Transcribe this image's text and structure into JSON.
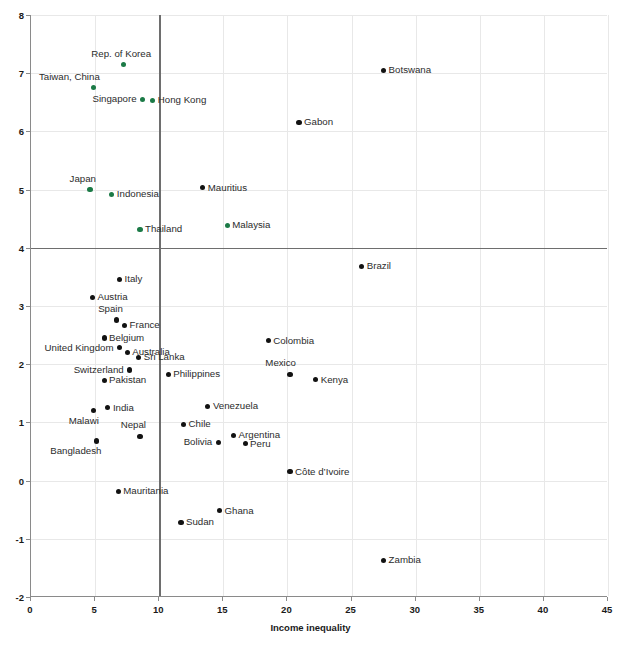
{
  "axis": {
    "xlabel": "Income inequality",
    "ylabel": "",
    "xticks": [
      "0",
      "5",
      "10",
      "15",
      "20",
      "25",
      "30",
      "35",
      "40",
      "45"
    ],
    "yticks": [
      "8",
      "7",
      "6",
      "5",
      "4",
      "3",
      "2",
      "1",
      "0",
      "-1",
      "-2"
    ]
  },
  "colors": {
    "asia_green": "#1b7a46",
    "other_black": "#121212",
    "grid": "#e8e8e8",
    "reference_line": "#6e6e6e",
    "axis": "#8a8a8a"
  },
  "chart_data": {
    "type": "scatter",
    "title": "",
    "xlabel": "Income inequality",
    "ylabel": "",
    "xlim": [
      0,
      45
    ],
    "ylim": [
      -2,
      8
    ],
    "xticks": [
      0,
      5,
      10,
      15,
      20,
      25,
      30,
      35,
      40,
      45
    ],
    "yticks": [
      8,
      7,
      6,
      5,
      4,
      3,
      2,
      1,
      0,
      -1,
      -2
    ],
    "grid": true,
    "legend": "none",
    "reference_lines": {
      "horizontal": 4,
      "vertical": 10
    },
    "series": [
      {
        "name": "East and Southeast Asia",
        "color": "#1b7a46",
        "points": [
          {
            "label": "Rep. of Korea",
            "x": 7.2,
            "y": 7.15,
            "lpos": "above"
          },
          {
            "label": "Taiwan, China",
            "x": 4.9,
            "y": 6.75,
            "lpos": "above-left"
          },
          {
            "label": "Singapore",
            "x": 8.7,
            "y": 6.55,
            "lpos": "left"
          },
          {
            "label": "Hong Kong",
            "x": 9.5,
            "y": 6.53,
            "lpos": "right"
          },
          {
            "label": "Japan",
            "x": 4.6,
            "y": 5.0,
            "lpos": "above-left"
          },
          {
            "label": "Indonesia",
            "x": 6.3,
            "y": 4.92,
            "lpos": "right"
          },
          {
            "label": "Thailand",
            "x": 8.5,
            "y": 4.32,
            "lpos": "right"
          },
          {
            "label": "Malaysia",
            "x": 15.3,
            "y": 4.38,
            "lpos": "right"
          }
        ]
      },
      {
        "name": "Rest of the world",
        "color": "#121212",
        "points": [
          {
            "label": "Botswana",
            "x": 27.5,
            "y": 7.05,
            "lpos": "right"
          },
          {
            "label": "Gabon",
            "x": 20.9,
            "y": 6.15,
            "lpos": "right"
          },
          {
            "label": "Mauritius",
            "x": 13.4,
            "y": 5.03,
            "lpos": "right"
          },
          {
            "label": "Brazil",
            "x": 25.8,
            "y": 3.68,
            "lpos": "right"
          },
          {
            "label": "Italy",
            "x": 6.9,
            "y": 3.45,
            "lpos": "right"
          },
          {
            "label": "Austria",
            "x": 4.8,
            "y": 3.15,
            "lpos": "right"
          },
          {
            "label": "Spain",
            "x": 6.7,
            "y": 2.76,
            "lpos": "above-left"
          },
          {
            "label": "France",
            "x": 7.3,
            "y": 2.66,
            "lpos": "right"
          },
          {
            "label": "Belgium",
            "x": 5.7,
            "y": 2.45,
            "lpos": "right"
          },
          {
            "label": "United Kingdom",
            "x": 6.9,
            "y": 2.28,
            "lpos": "left"
          },
          {
            "label": "Australia",
            "x": 7.5,
            "y": 2.2,
            "lpos": "right"
          },
          {
            "label": "Sri Lanka",
            "x": 8.4,
            "y": 2.12,
            "lpos": "right"
          },
          {
            "label": "Colombia",
            "x": 18.5,
            "y": 2.4,
            "lpos": "right"
          },
          {
            "label": "Switzerland",
            "x": 7.7,
            "y": 1.9,
            "lpos": "left"
          },
          {
            "label": "Philippines",
            "x": 10.7,
            "y": 1.82,
            "lpos": "right"
          },
          {
            "label": "Mexico",
            "x": 20.2,
            "y": 1.83,
            "lpos": "above-left"
          },
          {
            "label": "Pakistan",
            "x": 5.7,
            "y": 1.72,
            "lpos": "right"
          },
          {
            "label": "Kenya",
            "x": 22.2,
            "y": 1.73,
            "lpos": "right"
          },
          {
            "label": "India",
            "x": 6.0,
            "y": 1.25,
            "lpos": "right"
          },
          {
            "label": "Malawi",
            "x": 4.9,
            "y": 1.2,
            "lpos": "below-left"
          },
          {
            "label": "Venezuela",
            "x": 13.8,
            "y": 1.28,
            "lpos": "right"
          },
          {
            "label": "Chile",
            "x": 11.9,
            "y": 0.96,
            "lpos": "right"
          },
          {
            "label": "Nepal",
            "x": 8.5,
            "y": 0.76,
            "lpos": "above-left"
          },
          {
            "label": "Argentina",
            "x": 15.8,
            "y": 0.78,
            "lpos": "right"
          },
          {
            "label": "Bolivia",
            "x": 14.6,
            "y": 0.65,
            "lpos": "left"
          },
          {
            "label": "Peru",
            "x": 16.7,
            "y": 0.63,
            "lpos": "right"
          },
          {
            "label": "Bangladesh",
            "x": 5.1,
            "y": 0.68,
            "lpos": "below-left"
          },
          {
            "label": "Côte d’Ivoire",
            "x": 20.2,
            "y": 0.15,
            "lpos": "right"
          },
          {
            "label": "Mauritania",
            "x": 6.8,
            "y": -0.19,
            "lpos": "right"
          },
          {
            "label": "Ghana",
            "x": 14.7,
            "y": -0.52,
            "lpos": "right"
          },
          {
            "label": "Sudan",
            "x": 11.7,
            "y": -0.72,
            "lpos": "right"
          },
          {
            "label": "Zambia",
            "x": 27.5,
            "y": -1.37,
            "lpos": "right"
          }
        ]
      }
    ]
  }
}
